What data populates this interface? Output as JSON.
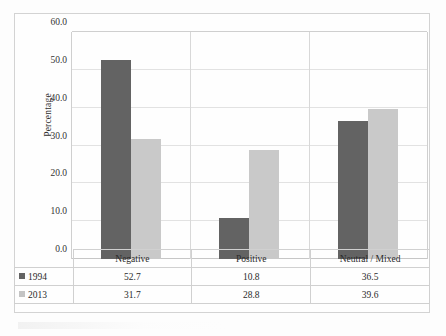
{
  "chart_data": {
    "type": "bar",
    "title": "",
    "xlabel": "",
    "ylabel": "Percentage",
    "ylim": [
      0,
      60
    ],
    "ytick_step": 10,
    "ytick_labels": [
      "60.0",
      "50.0",
      "40.0",
      "30.0",
      "20.0",
      "10.0",
      "0.0"
    ],
    "grid": true,
    "legend_position": "data-table-row-headers",
    "categories": [
      "Negative",
      "Positive",
      "Neutral / Mixed"
    ],
    "series": [
      {
        "name": "1994",
        "color": "#636363",
        "values": [
          52.7,
          10.8,
          36.5
        ]
      },
      {
        "name": "2013",
        "color": "#c9c9c9",
        "values": [
          31.7,
          28.8,
          39.6
        ]
      }
    ]
  },
  "data_table": {
    "corner_label": "",
    "category_row": [
      "Negative",
      "Positive",
      "Neutral / Mixed"
    ],
    "rows": [
      {
        "label": "1994",
        "swatch": "legend-swatch-dark",
        "cells": [
          "52.7",
          "10.8",
          "36.5"
        ]
      },
      {
        "label": "2013",
        "swatch": "legend-swatch-light",
        "cells": [
          "31.7",
          "28.8",
          "39.6"
        ]
      }
    ]
  },
  "colors": {
    "series_1994": "#636363",
    "series_2013": "#c9c9c9",
    "gridline": "#e2e2e2",
    "frame": "#d3d3d3",
    "background": "#fdfdfd"
  }
}
